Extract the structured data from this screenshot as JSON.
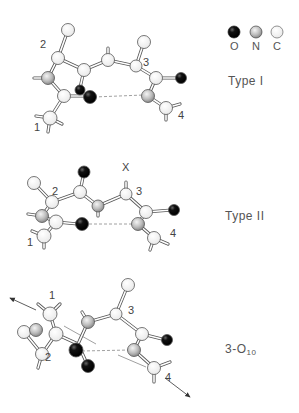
{
  "legend": {
    "items": [
      {
        "symbol": "O",
        "color": "#111111",
        "label": "O"
      },
      {
        "symbol": "N",
        "color": "#bdbdbd",
        "label": "N"
      },
      {
        "symbol": "C",
        "color": "#ffffff",
        "label": "C"
      }
    ]
  },
  "panels": [
    {
      "title": "Type I",
      "residue_labels": [
        "1",
        "2",
        "3",
        "4"
      ]
    },
    {
      "title": "Type II",
      "residue_labels": [
        "1",
        "2",
        "3",
        "4"
      ],
      "marker": "X"
    },
    {
      "title_main": "3-O",
      "title_sub": "10",
      "residue_labels": [
        "1",
        "2",
        "3",
        "4"
      ]
    }
  ]
}
